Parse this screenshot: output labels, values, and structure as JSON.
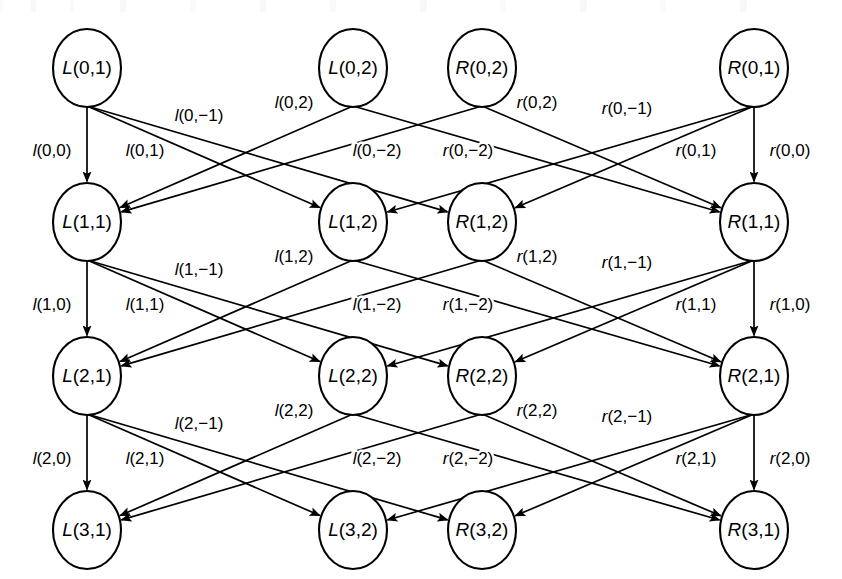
{
  "figure": {
    "type": "trellis-diagram",
    "title": "",
    "canvas": {
      "width": 842,
      "height": 579
    },
    "rows": [
      0,
      1,
      2,
      3
    ],
    "row_y": [
      68,
      222,
      376,
      530
    ],
    "column_x": [
      87,
      353,
      482,
      754
    ],
    "node_rx": 34,
    "node_ry": 39,
    "ink_color": "#000000",
    "background_color": "#ffffff"
  },
  "nodes": [
    {
      "id": "L01",
      "label": "L(0,1)",
      "col": 0,
      "row": 0,
      "x": 87,
      "y": 68
    },
    {
      "id": "L02",
      "label": "L(0,2)",
      "col": 1,
      "row": 0,
      "x": 353,
      "y": 68
    },
    {
      "id": "R02",
      "label": "R(0,2)",
      "col": 2,
      "row": 0,
      "x": 482,
      "y": 68
    },
    {
      "id": "R01",
      "label": "R(0,1)",
      "col": 3,
      "row": 0,
      "x": 754,
      "y": 68
    },
    {
      "id": "L11",
      "label": "L(1,1)",
      "col": 0,
      "row": 1,
      "x": 87,
      "y": 222
    },
    {
      "id": "L12",
      "label": "L(1,2)",
      "col": 1,
      "row": 1,
      "x": 353,
      "y": 222
    },
    {
      "id": "R12",
      "label": "R(1,2)",
      "col": 2,
      "row": 1,
      "x": 482,
      "y": 222
    },
    {
      "id": "R11",
      "label": "R(1,1)",
      "col": 3,
      "row": 1,
      "x": 754,
      "y": 222
    },
    {
      "id": "L21",
      "label": "L(2,1)",
      "col": 0,
      "row": 2,
      "x": 87,
      "y": 376
    },
    {
      "id": "L22",
      "label": "L(2,2)",
      "col": 1,
      "row": 2,
      "x": 353,
      "y": 376
    },
    {
      "id": "R22",
      "label": "R(2,2)",
      "col": 2,
      "row": 2,
      "x": 482,
      "y": 376
    },
    {
      "id": "R21",
      "label": "R(2,1)",
      "col": 3,
      "row": 2,
      "x": 754,
      "y": 376
    },
    {
      "id": "L31",
      "label": "L(3,1)",
      "col": 0,
      "row": 3,
      "x": 87,
      "y": 530
    },
    {
      "id": "L32",
      "label": "L(3,2)",
      "col": 1,
      "row": 3,
      "x": 353,
      "y": 530
    },
    {
      "id": "R32",
      "label": "R(3,2)",
      "col": 2,
      "row": 3,
      "x": 482,
      "y": 530
    },
    {
      "id": "R31",
      "label": "R(3,1)",
      "col": 3,
      "row": 3,
      "x": 754,
      "y": 530
    }
  ],
  "stages": [
    {
      "k": 0,
      "edges": [
        {
          "from": "L01",
          "to": "L11",
          "label": "l(0,0)",
          "label_x": 52,
          "label_y": 152
        },
        {
          "from": "L01",
          "to": "L12",
          "label": "l(0,1)",
          "label_x": 145,
          "label_y": 152
        },
        {
          "from": "L01",
          "to": "R12",
          "label": "l(0,-1)",
          "label_x": 199,
          "label_y": 117
        },
        {
          "from": "L02",
          "to": "L11",
          "label": "l(0,2)",
          "label_x": 294,
          "label_y": 104
        },
        {
          "from": "L02",
          "to": "R11",
          "label": "l(0,-2)",
          "label_x": 377,
          "label_y": 152
        },
        {
          "from": "R02",
          "to": "R11",
          "label": "r(0,2)",
          "label_x": 537,
          "label_y": 104
        },
        {
          "from": "R02",
          "to": "L11",
          "label": "r(0,-2)",
          "label_x": 468,
          "label_y": 152
        },
        {
          "from": "R01",
          "to": "L12",
          "label": "r(0,-1)",
          "label_x": 627,
          "label_y": 110
        },
        {
          "from": "R01",
          "to": "R12",
          "label": "r(0,1)",
          "label_x": 696,
          "label_y": 152
        },
        {
          "from": "R01",
          "to": "R11",
          "label": "r(0,0)",
          "label_x": 790,
          "label_y": 152
        }
      ]
    },
    {
      "k": 1,
      "edges": [
        {
          "from": "L11",
          "to": "L21",
          "label": "l(1,0)",
          "label_x": 52,
          "label_y": 306
        },
        {
          "from": "L11",
          "to": "L22",
          "label": "l(1,1)",
          "label_x": 145,
          "label_y": 306
        },
        {
          "from": "L11",
          "to": "R22",
          "label": "l(1,-1)",
          "label_x": 199,
          "label_y": 271
        },
        {
          "from": "L12",
          "to": "L21",
          "label": "l(1,2)",
          "label_x": 294,
          "label_y": 258
        },
        {
          "from": "L12",
          "to": "R21",
          "label": "l(1,-2)",
          "label_x": 377,
          "label_y": 306
        },
        {
          "from": "R12",
          "to": "R21",
          "label": "r(1,2)",
          "label_x": 537,
          "label_y": 258
        },
        {
          "from": "R12",
          "to": "L21",
          "label": "r(1,-2)",
          "label_x": 468,
          "label_y": 306
        },
        {
          "from": "R11",
          "to": "L22",
          "label": "r(1,-1)",
          "label_x": 627,
          "label_y": 264
        },
        {
          "from": "R11",
          "to": "R22",
          "label": "r(1,1)",
          "label_x": 696,
          "label_y": 306
        },
        {
          "from": "R11",
          "to": "R21",
          "label": "r(1,0)",
          "label_x": 790,
          "label_y": 306
        }
      ]
    },
    {
      "k": 2,
      "edges": [
        {
          "from": "L21",
          "to": "L31",
          "label": "l(2,0)",
          "label_x": 52,
          "label_y": 460
        },
        {
          "from": "L21",
          "to": "L32",
          "label": "l(2,1)",
          "label_x": 145,
          "label_y": 460
        },
        {
          "from": "L21",
          "to": "R32",
          "label": "l(2,-1)",
          "label_x": 199,
          "label_y": 425
        },
        {
          "from": "L22",
          "to": "L31",
          "label": "l(2,2)",
          "label_x": 294,
          "label_y": 412
        },
        {
          "from": "L22",
          "to": "R31",
          "label": "l(2,-2)",
          "label_x": 377,
          "label_y": 460
        },
        {
          "from": "R22",
          "to": "R31",
          "label": "r(2,2)",
          "label_x": 537,
          "label_y": 412
        },
        {
          "from": "R22",
          "to": "L31",
          "label": "r(2,-2)",
          "label_x": 468,
          "label_y": 460
        },
        {
          "from": "R21",
          "to": "L32",
          "label": "r(2,-1)",
          "label_x": 627,
          "label_y": 418
        },
        {
          "from": "R21",
          "to": "R32",
          "label": "r(2,1)",
          "label_x": 696,
          "label_y": 460
        },
        {
          "from": "R21",
          "to": "R31",
          "label": "r(2,0)",
          "label_x": 790,
          "label_y": 460
        }
      ]
    }
  ]
}
